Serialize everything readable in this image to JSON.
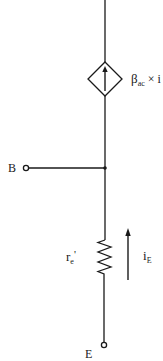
{
  "diagram": {
    "type": "transistor-ac-equivalent-circuit",
    "colors": {
      "line": "#1a1a1a",
      "background": "#ffffff"
    },
    "current_source": {
      "symbol": "dependent-current-source-diamond",
      "arrow_direction": "up",
      "label_main": "β",
      "label_sub": "ac",
      "label_rest": " × i"
    },
    "base_terminal": {
      "label": "B"
    },
    "resistor": {
      "label_main": "r",
      "label_sub": "e",
      "label_prime": "'"
    },
    "emitter_current": {
      "label_main": "i",
      "label_sub": "E",
      "arrow_direction": "up"
    },
    "emitter_terminal": {
      "label": "E"
    }
  }
}
